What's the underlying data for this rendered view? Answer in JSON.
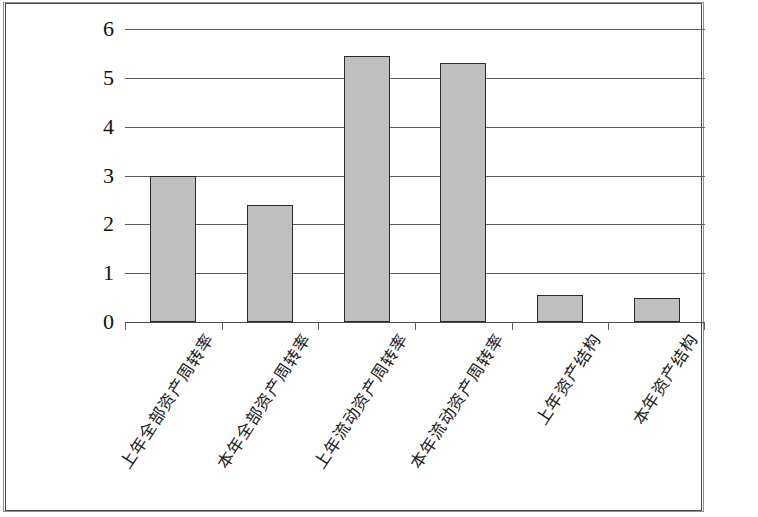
{
  "chart_data": {
    "type": "bar",
    "title": "",
    "subtitle": "",
    "xlabel": "",
    "ylabel": "",
    "categories": [
      "上年全部资产周转率",
      "本年全部资产周转率",
      "上年流动资产周转率",
      "本年流动资产周转率",
      "上年资产结构",
      "本年资产结构"
    ],
    "values": [
      3.0,
      2.4,
      5.45,
      5.3,
      0.55,
      0.5
    ],
    "ylim": [
      0,
      6
    ],
    "ytick_labels": [
      "0",
      "1",
      "2",
      "3",
      "4",
      "5",
      "6"
    ],
    "ytick_values": [
      0,
      1,
      2,
      3,
      4,
      5,
      6
    ],
    "grid": true,
    "legend": false,
    "legend_position": "none",
    "bar_fill_color": "#bfbfbf",
    "bar_border_color": "#2b2b2b",
    "gridline_color": "#5c5c5c",
    "background_color": "#ffffff",
    "x_label_rotation": -57
  }
}
